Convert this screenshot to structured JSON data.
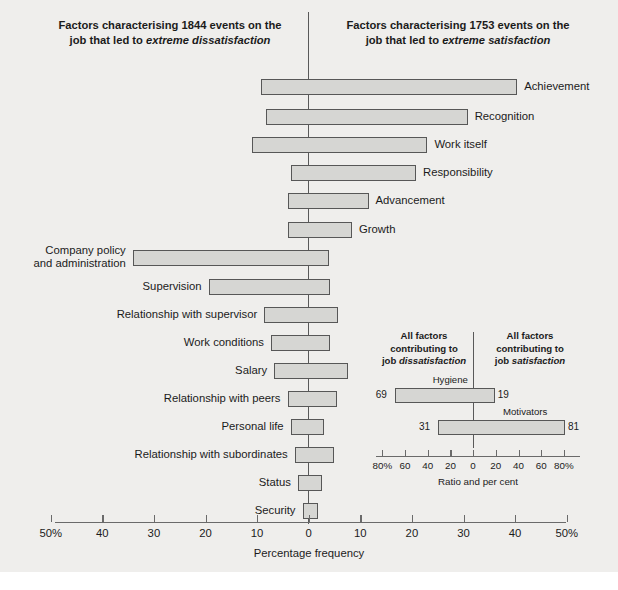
{
  "figure": {
    "headers": {
      "left_line1": "Factors characterising 1844 events on the",
      "left_line2_pre": "job that led to ",
      "left_line2_em": "extreme dissatisfaction",
      "right_line1": "Factors characterising 1753 events on the",
      "right_line2_pre": "job that led to ",
      "right_line2_em": "extreme satisfaction"
    },
    "axis": {
      "title": "Percentage frequency",
      "ticks": [
        "50%",
        "40",
        "30",
        "20",
        "10",
        "0",
        "10",
        "20",
        "30",
        "40",
        "50%"
      ],
      "tick_values": [
        -50,
        -40,
        -30,
        -20,
        -10,
        0,
        10,
        20,
        30,
        40,
        50
      ],
      "min": -55,
      "max": 50
    },
    "colors": {
      "background": "#efeeec",
      "bar_fill": "#d6d6d3",
      "bar_stroke": "#575757",
      "divider": "#595959",
      "text": "#1b1b1b"
    }
  },
  "chart_data": {
    "type": "bar",
    "xlabel": "Percentage frequency",
    "ylabel": "",
    "xlim": [
      -55,
      50
    ],
    "grid": false,
    "legend": "none",
    "note": "Diverging bar chart. Negative (left) values = frequency leading to extreme dissatisfaction; positive (right) values = frequency leading to extreme satisfaction.",
    "series": [
      {
        "name": "Dissatisfaction (left)",
        "values": [
          -9.2,
          -8.2,
          -11.0,
          -3.5,
          -4.1,
          -4.1,
          -34.1,
          -19.4,
          -8.6,
          -7.3,
          -6.7,
          -4.1,
          -3.5,
          -2.7,
          -2.1,
          -1.2
        ]
      },
      {
        "name": "Satisfaction (right)",
        "values": [
          40.4,
          30.8,
          23.0,
          20.8,
          11.6,
          8.4,
          3.9,
          4.1,
          5.7,
          4.1,
          7.6,
          5.5,
          2.9,
          4.9,
          2.5,
          1.8
        ]
      }
    ],
    "categories": [
      "Achievement",
      "Recognition",
      "Work itself",
      "Responsibility",
      "Advancement",
      "Growth",
      "Company policy and administration",
      "Supervision",
      "Relationship with supervisor",
      "Work conditions",
      "Salary",
      "Relationship with peers",
      "Personal life",
      "Relationship with subordinates",
      "Status",
      "Security"
    ],
    "bars": [
      {
        "label": "Achievement",
        "label_side": "right",
        "label_lines": [
          "Achievement"
        ],
        "left": -9.2,
        "right": 40.4,
        "y": 74
      },
      {
        "label": "Recognition",
        "label_side": "right",
        "label_lines": [
          "Recognition"
        ],
        "left": -8.2,
        "right": 30.8,
        "y": 104
      },
      {
        "label": "Work itself",
        "label_side": "right",
        "label_lines": [
          "Work itself"
        ],
        "left": -11.0,
        "right": 23.0,
        "y": 132
      },
      {
        "label": "Responsibility",
        "label_side": "right",
        "label_lines": [
          "Responsibility"
        ],
        "left": -3.5,
        "right": 20.8,
        "y": 160
      },
      {
        "label": "Advancement",
        "label_side": "right",
        "label_lines": [
          "Advancement"
        ],
        "left": -4.1,
        "right": 11.6,
        "y": 188
      },
      {
        "label": "Growth",
        "label_side": "right",
        "label_lines": [
          "Growth"
        ],
        "left": -4.1,
        "right": 8.4,
        "y": 217
      },
      {
        "label": "Company policy and administration",
        "label_side": "left",
        "label_lines": [
          "Company policy",
          "and administration"
        ],
        "left": -34.1,
        "right": 3.9,
        "y": 245
      },
      {
        "label": "Supervision",
        "label_side": "left",
        "label_lines": [
          "Supervision"
        ],
        "left": -19.4,
        "right": 4.1,
        "y": 274
      },
      {
        "label": "Relationship with supervisor",
        "label_side": "left",
        "label_lines": [
          "Relationship with supervisor"
        ],
        "left": -8.6,
        "right": 5.7,
        "y": 302
      },
      {
        "label": "Work conditions",
        "label_side": "left",
        "label_lines": [
          "Work conditions"
        ],
        "left": -7.3,
        "right": 4.1,
        "y": 330
      },
      {
        "label": "Salary",
        "label_side": "left",
        "label_lines": [
          "Salary"
        ],
        "left": -6.7,
        "right": 7.6,
        "y": 358
      },
      {
        "label": "Relationship with peers",
        "label_side": "left",
        "label_lines": [
          "Relationship with peers"
        ],
        "left": -4.1,
        "right": 5.5,
        "y": 386
      },
      {
        "label": "Personal life",
        "label_side": "left",
        "label_lines": [
          "Personal life"
        ],
        "left": -3.5,
        "right": 2.9,
        "y": 414
      },
      {
        "label": "Relationship with subordinates",
        "label_side": "left",
        "label_lines": [
          "Relationship with subordinates"
        ],
        "left": -2.7,
        "right": 4.9,
        "y": 442
      },
      {
        "label": "Status",
        "label_side": "left",
        "label_lines": [
          "Status"
        ],
        "left": -2.1,
        "right": 2.5,
        "y": 470
      },
      {
        "label": "Security",
        "label_side": "left",
        "label_lines": [
          "Security"
        ],
        "left": -1.2,
        "right": 1.8,
        "y": 498
      }
    ]
  },
  "inset": {
    "type": "bar",
    "headers": {
      "left_l1": "All factors",
      "left_l2": "contributing to",
      "left_l3_pre": "job ",
      "left_l3_em": "dissatisfaction",
      "right_l1": "All factors",
      "right_l2": "contributing to",
      "right_l3_pre": "job ",
      "right_l3_em": "satisfaction"
    },
    "axis": {
      "title": "Ratio and per cent",
      "ticks": [
        "80%",
        "60",
        "40",
        "20",
        "0",
        "20",
        "40",
        "60",
        "80%"
      ],
      "tick_values": [
        -80,
        -60,
        -40,
        -20,
        0,
        20,
        40,
        60,
        80
      ],
      "min": -90,
      "max": 90
    },
    "bars": [
      {
        "label": "Hygiene",
        "left": -69,
        "right": 19,
        "left_value": "69",
        "right_value": "19",
        "y": 58
      },
      {
        "label": "Motivators",
        "left": -31,
        "right": 81,
        "left_value": "31",
        "right_value": "81",
        "y": 90
      }
    ]
  }
}
